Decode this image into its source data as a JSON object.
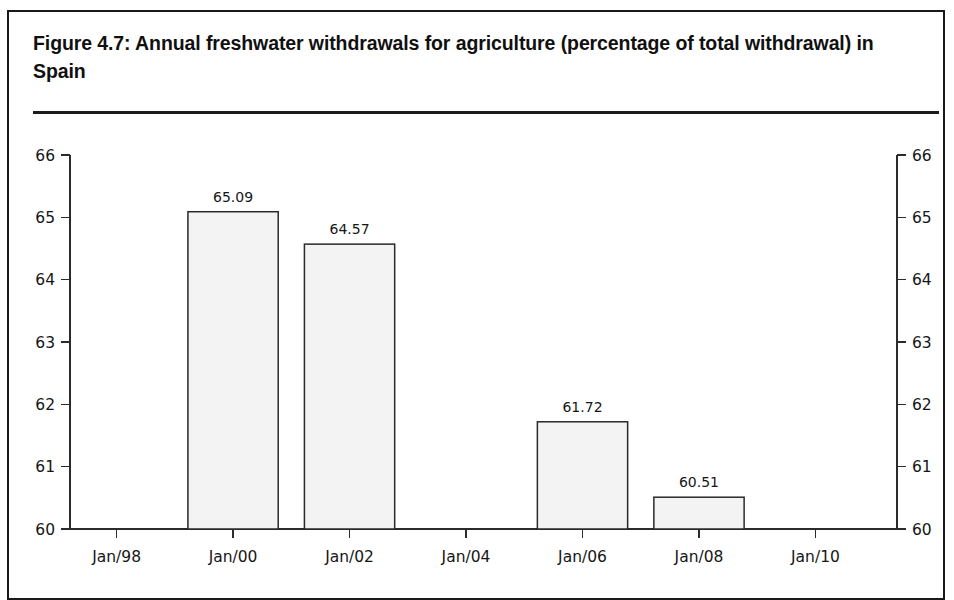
{
  "figure": {
    "title": "Figure 4.7:  Annual freshwater withdrawals for agriculture (percentage of total withdrawal) in Spain"
  },
  "chart_data": {
    "type": "bar",
    "title": "Figure 4.7:  Annual freshwater withdrawals for agriculture (percentage of total withdrawal) in Spain",
    "xlabel": "",
    "ylabel": "",
    "ylim": [
      60,
      66
    ],
    "ytick_labels_left": [
      "66",
      "65",
      "64",
      "63",
      "62",
      "61",
      "60"
    ],
    "ytick_labels_right": [
      "66",
      "65",
      "64",
      "63",
      "62",
      "61",
      "60"
    ],
    "ytick_values": [
      66,
      65,
      64,
      63,
      62,
      61,
      60
    ],
    "xtick_labels": [
      "Jan/98",
      "Jan/00",
      "Jan/02",
      "Jan/04",
      "Jan/06",
      "Jan/08",
      "Jan/10"
    ],
    "xtick_positions": [
      1998,
      2000,
      2002,
      2004,
      2006,
      2008,
      2010
    ],
    "x_range": [
      1997.2,
      2011.4
    ],
    "grid": false,
    "legend": null,
    "bar_value_labels": true,
    "categories": [
      "Jan/00",
      "Jan/02",
      "Jan/06",
      "Jan/08"
    ],
    "values": [
      65.09,
      64.57,
      61.72,
      60.51
    ],
    "bars": [
      {
        "category": "Jan/00",
        "x_center": 2000.0,
        "value": 65.09,
        "label": "65.09"
      },
      {
        "category": "Jan/02",
        "x_center": 2002.0,
        "value": 64.57,
        "label": "64.57"
      },
      {
        "category": "Jan/06",
        "x_center": 2006.0,
        "value": 61.72,
        "label": "61.72"
      },
      {
        "category": "Jan/08",
        "x_center": 2008.0,
        "value": 60.51,
        "label": "60.51"
      }
    ],
    "bar_width_years": 1.55,
    "colors": {
      "bar_fill": "#f3f3f3",
      "bar_stroke": "#2a2a2a",
      "axis": "#2b2b2b",
      "text": "#161616",
      "frame": "#1a1a1a"
    }
  }
}
